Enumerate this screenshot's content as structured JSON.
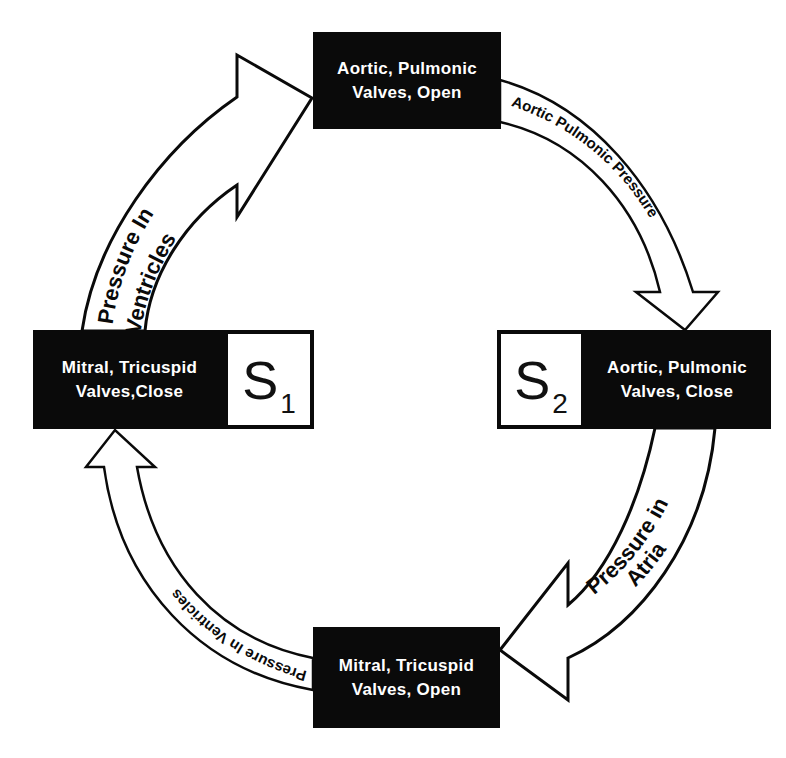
{
  "diagram": {
    "nodes": {
      "top": {
        "line1": "Aortic, Pulmonic",
        "line2": "Valves, Open"
      },
      "left": {
        "line1": "Mitral, Tricuspid",
        "line2": "Valves,Close",
        "sound_main": "S",
        "sound_sub": "1"
      },
      "right": {
        "line1": "Aortic, Pulmonic",
        "line2": "Valves, Close",
        "sound_main": "S",
        "sound_sub": "2"
      },
      "bottom": {
        "line1": "Mitral, Tricuspid",
        "line2": "Valves, Open"
      }
    },
    "arrows": {
      "left_to_top": {
        "line1": "Pressure In",
        "line2": "Ventricles"
      },
      "top_to_right": {
        "label": "Aortic Pulmonic Pressure"
      },
      "right_to_bottom": {
        "line1": "Pressure in",
        "line2": "Atria"
      },
      "bottom_to_left": {
        "label": "Pressure In Ventricles"
      }
    },
    "colors": {
      "fill": "#0a0a0a",
      "background": "#ffffff",
      "text_on_dark": "#ffffff"
    }
  }
}
